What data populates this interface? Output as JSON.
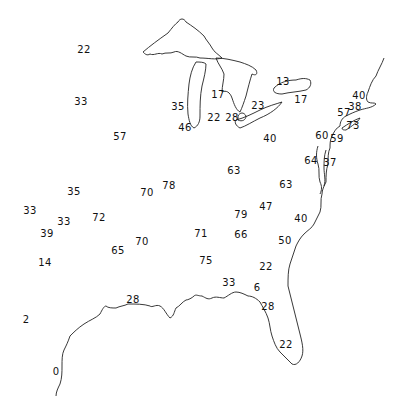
{
  "map": {
    "region": "Eastern United States",
    "labels": [
      {
        "value": "22",
        "x": 84,
        "y": 50
      },
      {
        "value": "33",
        "x": 81,
        "y": 102
      },
      {
        "value": "57",
        "x": 120,
        "y": 137
      },
      {
        "value": "35",
        "x": 178,
        "y": 107
      },
      {
        "value": "46",
        "x": 185,
        "y": 128
      },
      {
        "value": "17",
        "x": 218,
        "y": 95
      },
      {
        "value": "22",
        "x": 214,
        "y": 118
      },
      {
        "value": "28",
        "x": 232,
        "y": 118
      },
      {
        "value": "23",
        "x": 258,
        "y": 106
      },
      {
        "value": "13",
        "x": 283,
        "y": 82
      },
      {
        "value": "17",
        "x": 301,
        "y": 100
      },
      {
        "value": "40",
        "x": 270,
        "y": 139
      },
      {
        "value": "40",
        "x": 359,
        "y": 96
      },
      {
        "value": "38",
        "x": 355,
        "y": 107
      },
      {
        "value": "57",
        "x": 344,
        "y": 113
      },
      {
        "value": "73",
        "x": 353,
        "y": 126
      },
      {
        "value": "60",
        "x": 322,
        "y": 136
      },
      {
        "value": "59",
        "x": 337,
        "y": 139
      },
      {
        "value": "64",
        "x": 311,
        "y": 161
      },
      {
        "value": "37",
        "x": 330,
        "y": 163
      },
      {
        "value": "63",
        "x": 234,
        "y": 171
      },
      {
        "value": "63",
        "x": 286,
        "y": 185
      },
      {
        "value": "35",
        "x": 74,
        "y": 192
      },
      {
        "value": "70",
        "x": 147,
        "y": 193
      },
      {
        "value": "78",
        "x": 169,
        "y": 186
      },
      {
        "value": "33",
        "x": 30,
        "y": 211
      },
      {
        "value": "33",
        "x": 64,
        "y": 222
      },
      {
        "value": "72",
        "x": 99,
        "y": 218
      },
      {
        "value": "39",
        "x": 47,
        "y": 234
      },
      {
        "value": "70",
        "x": 142,
        "y": 242
      },
      {
        "value": "65",
        "x": 118,
        "y": 251
      },
      {
        "value": "14",
        "x": 45,
        "y": 263
      },
      {
        "value": "79",
        "x": 241,
        "y": 215
      },
      {
        "value": "47",
        "x": 266,
        "y": 207
      },
      {
        "value": "40",
        "x": 301,
        "y": 219
      },
      {
        "value": "71",
        "x": 201,
        "y": 234
      },
      {
        "value": "66",
        "x": 241,
        "y": 235
      },
      {
        "value": "50",
        "x": 285,
        "y": 241
      },
      {
        "value": "75",
        "x": 206,
        "y": 261
      },
      {
        "value": "22",
        "x": 266,
        "y": 267
      },
      {
        "value": "33",
        "x": 229,
        "y": 283
      },
      {
        "value": "6",
        "x": 257,
        "y": 288
      },
      {
        "value": "28",
        "x": 133,
        "y": 300
      },
      {
        "value": "28",
        "x": 268,
        "y": 307
      },
      {
        "value": "22",
        "x": 286,
        "y": 345
      },
      {
        "value": "2",
        "x": 26,
        "y": 320
      },
      {
        "value": "0",
        "x": 56,
        "y": 372
      }
    ]
  }
}
